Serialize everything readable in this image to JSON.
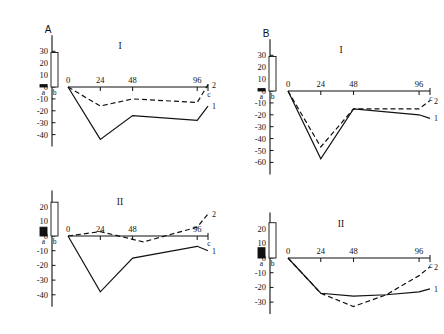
{
  "figure": {
    "panels": [
      {
        "id": "A-I",
        "letter": "A",
        "roman": "I",
        "y_ticks": [
          30,
          20,
          10,
          0,
          -10,
          -20,
          -30,
          -40
        ],
        "y_tick_labels": [
          "30",
          "20",
          "10",
          "0",
          "-10",
          "-20",
          "-30",
          "-40"
        ],
        "x_ticks": [
          0,
          24,
          48,
          96
        ],
        "x_tick_labels": [
          "0",
          "24",
          "48",
          "96"
        ],
        "c_label": "c",
        "bars": [
          {
            "label": "a",
            "value": 2,
            "fill": "solid"
          },
          {
            "label": "b",
            "value": 29,
            "fill": "open"
          }
        ],
        "curves": [
          {
            "label": "1",
            "style": "solid",
            "x": [
              0,
              24,
              48,
              96,
              104
            ],
            "y": [
              0,
              -44,
              -24,
              -28,
              -16
            ]
          },
          {
            "label": "2",
            "style": "dashed",
            "x": [
              0,
              24,
              48,
              96,
              104
            ],
            "y": [
              0,
              -16,
              -10,
              -13,
              2
            ]
          }
        ]
      },
      {
        "id": "A-II",
        "letter": "",
        "roman": "II",
        "y_ticks": [
          20,
          10,
          0,
          -10,
          -20,
          -30,
          -40
        ],
        "y_tick_labels": [
          "20",
          "10",
          "0",
          "-10",
          "-20",
          "-30",
          "-40"
        ],
        "x_ticks": [
          0,
          24,
          48,
          96
        ],
        "x_tick_labels": [
          "0",
          "24",
          "48",
          "96"
        ],
        "c_label": "c",
        "bars": [
          {
            "label": "a",
            "value": 6,
            "fill": "solid"
          },
          {
            "label": "b",
            "value": 23,
            "fill": "open"
          }
        ],
        "curves": [
          {
            "label": "1",
            "style": "solid",
            "x": [
              0,
              24,
              48,
              96,
              104
            ],
            "y": [
              0,
              -38,
              -15,
              -7,
              -10
            ]
          },
          {
            "label": "2",
            "style": "dashed",
            "x": [
              0,
              24,
              56,
              96,
              104
            ],
            "y": [
              0,
              3,
              -4,
              6,
              15
            ]
          }
        ]
      },
      {
        "id": "B-I",
        "letter": "B",
        "roman": "I",
        "y_ticks": [
          30,
          20,
          10,
          0,
          -10,
          -20,
          -30,
          -40,
          -50,
          -60
        ],
        "y_tick_labels": [
          "30",
          "20",
          "10",
          "0",
          "-10",
          "-20",
          "-30",
          "-40",
          "-50",
          "-60"
        ],
        "x_ticks": [
          0,
          24,
          48,
          96
        ],
        "x_tick_labels": [
          "0",
          "24",
          "48",
          "96"
        ],
        "c_label": "c",
        "bars": [
          {
            "label": "a",
            "value": 2,
            "fill": "solid"
          },
          {
            "label": "b",
            "value": 29,
            "fill": "open"
          }
        ],
        "curves": [
          {
            "label": "1",
            "style": "solid",
            "x": [
              0,
              24,
              48,
              96,
              104
            ],
            "y": [
              0,
              -57,
              -15,
              -20,
              -23
            ]
          },
          {
            "label": "2",
            "style": "dashed",
            "x": [
              0,
              24,
              48,
              96,
              104
            ],
            "y": [
              0,
              -47,
              -15,
              -15,
              -8
            ]
          }
        ]
      },
      {
        "id": "B-II",
        "letter": "",
        "roman": "II",
        "y_ticks": [
          20,
          10,
          0,
          -10,
          -20,
          -30
        ],
        "y_tick_labels": [
          "20",
          "10",
          "0",
          "-10",
          "-20",
          "-30"
        ],
        "x_ticks": [
          0,
          24,
          48,
          96
        ],
        "x_tick_labels": [
          "0",
          "24",
          "48",
          "96"
        ],
        "c_label": "c",
        "bars": [
          {
            "label": "a",
            "value": 7,
            "fill": "solid"
          },
          {
            "label": "b",
            "value": 24,
            "fill": "open"
          }
        ],
        "curves": [
          {
            "label": "1",
            "style": "solid",
            "x": [
              0,
              24,
              48,
              72,
              96,
              104
            ],
            "y": [
              0,
              -24,
              -26,
              -25,
              -23,
              -21
            ]
          },
          {
            "label": "2",
            "style": "dashed",
            "x": [
              0,
              24,
              48,
              72,
              96,
              104
            ],
            "y": [
              0,
              -24,
              -33,
              -25,
              -12,
              -6
            ]
          }
        ]
      }
    ]
  },
  "chart_data": {
    "type": "line",
    "title": "",
    "xlabel": "",
    "ylabel": "",
    "grid": false,
    "legend": "inline-end-labels",
    "subplots": [
      {
        "name": "A-I",
        "panel_letter": "A",
        "panel_number": "I",
        "xlim": [
          0,
          104
        ],
        "ylim": [
          -45,
          32
        ],
        "xticks": [
          0,
          24,
          48,
          96
        ],
        "xticklabels": [
          "0",
          "24",
          "48",
          "96"
        ],
        "extra_xtick_label": "c",
        "yticks": [
          30,
          20,
          10,
          0,
          -10,
          -20,
          -30,
          -40
        ],
        "bars": {
          "categories": [
            "a",
            "b"
          ],
          "values": [
            2,
            29
          ],
          "styles": [
            "filled",
            "open"
          ]
        },
        "series": [
          {
            "name": "1",
            "style": "solid",
            "x": [
              0,
              24,
              48,
              96,
              104
            ],
            "values": [
              0,
              -44,
              -24,
              -28,
              -16
            ]
          },
          {
            "name": "2",
            "style": "dashed",
            "x": [
              0,
              24,
              48,
              96,
              104
            ],
            "values": [
              0,
              -16,
              -10,
              -13,
              2
            ]
          }
        ]
      },
      {
        "name": "A-II",
        "panel_letter": "A",
        "panel_number": "II",
        "xlim": [
          0,
          104
        ],
        "ylim": [
          -42,
          25
        ],
        "xticks": [
          0,
          24,
          48,
          96
        ],
        "xticklabels": [
          "0",
          "24",
          "48",
          "96"
        ],
        "extra_xtick_label": "c",
        "yticks": [
          20,
          10,
          0,
          -10,
          -20,
          -30,
          -40
        ],
        "bars": {
          "categories": [
            "a",
            "b"
          ],
          "values": [
            6,
            23
          ],
          "styles": [
            "filled",
            "open"
          ]
        },
        "series": [
          {
            "name": "1",
            "style": "solid",
            "x": [
              0,
              24,
              48,
              96,
              104
            ],
            "values": [
              0,
              -38,
              -15,
              -7,
              -10
            ]
          },
          {
            "name": "2",
            "style": "dashed",
            "x": [
              0,
              24,
              56,
              96,
              104
            ],
            "values": [
              0,
              3,
              -4,
              6,
              15
            ]
          }
        ]
      },
      {
        "name": "B-I",
        "panel_letter": "B",
        "panel_number": "I",
        "xlim": [
          0,
          104
        ],
        "ylim": [
          -62,
          32
        ],
        "xticks": [
          0,
          24,
          48,
          96
        ],
        "xticklabels": [
          "0",
          "24",
          "48",
          "96"
        ],
        "extra_xtick_label": "c",
        "yticks": [
          30,
          20,
          10,
          0,
          -10,
          -20,
          -30,
          -40,
          -50,
          -60
        ],
        "bars": {
          "categories": [
            "a",
            "b"
          ],
          "values": [
            2,
            29
          ],
          "styles": [
            "filled",
            "open"
          ]
        },
        "series": [
          {
            "name": "1",
            "style": "solid",
            "x": [
              0,
              24,
              48,
              96,
              104
            ],
            "values": [
              0,
              -57,
              -15,
              -20,
              -23
            ]
          },
          {
            "name": "2",
            "style": "dashed",
            "x": [
              0,
              24,
              48,
              96,
              104
            ],
            "values": [
              0,
              -47,
              -15,
              -15,
              -8
            ]
          }
        ]
      },
      {
        "name": "B-II",
        "panel_letter": "B",
        "panel_number": "II",
        "xlim": [
          0,
          104
        ],
        "ylim": [
          -36,
          26
        ],
        "xticks": [
          0,
          24,
          48,
          96
        ],
        "xticklabels": [
          "0",
          "24",
          "48",
          "96"
        ],
        "extra_xtick_label": "c",
        "yticks": [
          20,
          10,
          0,
          -10,
          -20,
          -30
        ],
        "bars": {
          "categories": [
            "a",
            "b"
          ],
          "values": [
            7,
            24
          ],
          "styles": [
            "filled",
            "open"
          ]
        },
        "series": [
          {
            "name": "1",
            "style": "solid",
            "x": [
              0,
              24,
              48,
              72,
              96,
              104
            ],
            "values": [
              0,
              -24,
              -26,
              -25,
              -23,
              -21
            ]
          },
          {
            "name": "2",
            "style": "dashed",
            "x": [
              0,
              24,
              48,
              72,
              96,
              104
            ],
            "values": [
              0,
              -24,
              -33,
              -25,
              -12,
              -6
            ]
          }
        ]
      }
    ]
  }
}
